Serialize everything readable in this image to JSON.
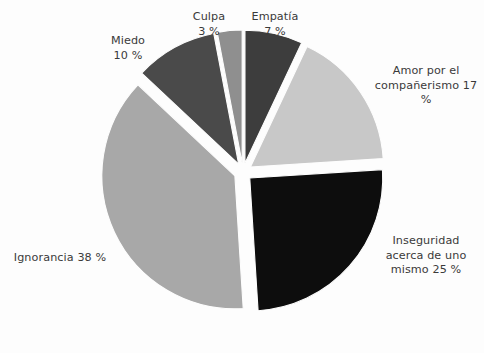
{
  "background_color": "#fdfdfd",
  "text_color": "#3a3a3a",
  "chart_data": {
    "type": "pie",
    "title": "",
    "subtitle": "",
    "xlabel": "",
    "ylabel": "",
    "legend_position": "none",
    "grid": false,
    "labels_outside": true,
    "exploded": true,
    "center": {
      "x": 243,
      "y": 172
    },
    "radius": 133,
    "explode_offset": 9,
    "start_angle_deg": -90,
    "direction": "clockwise",
    "categories": [
      "Empatía",
      "Amor por el compañerismo",
      "Inseguridad acerca de uno mismo",
      "Ignorancia",
      "Miedo",
      "Culpa"
    ],
    "values": [
      7,
      17,
      25,
      38,
      10,
      3
    ],
    "unit": "%",
    "colors": [
      "#3d3d3d",
      "#c8c8c8",
      "#0d0d0d",
      "#a8a8a8",
      "#4a4a4a",
      "#8f8f8f"
    ],
    "slices": [
      {
        "name": "Empatía",
        "value": 7,
        "value_text": "7 %",
        "color": "#3d3d3d",
        "label_text": "Empatía\n7 %",
        "start_angle_deg": -90,
        "end_angle_deg": -64.8,
        "mid_angle_deg": -77.4
      },
      {
        "name": "Amor por el compañerismo",
        "value": 17,
        "value_text": "17 %",
        "color": "#c8c8c8",
        "label_text": "Amor por el\ncompañerismo 17 %",
        "start_angle_deg": -64.8,
        "end_angle_deg": -3.6,
        "mid_angle_deg": -34.2
      },
      {
        "name": "Inseguridad acerca de uno mismo",
        "value": 25,
        "value_text": "25 %",
        "color": "#0d0d0d",
        "label_text": "Inseguridad\nacerca de uno\nmismo 25 %",
        "start_angle_deg": -3.6,
        "end_angle_deg": 86.4,
        "mid_angle_deg": 41.4
      },
      {
        "name": "Ignorancia",
        "value": 38,
        "value_text": "38 %",
        "color": "#a8a8a8",
        "label_text": "Ignorancia 38 %",
        "start_angle_deg": 86.4,
        "end_angle_deg": 223.2,
        "mid_angle_deg": 154.8
      },
      {
        "name": "Miedo",
        "value": 10,
        "value_text": "10 %",
        "color": "#4a4a4a",
        "label_text": "Miedo\n10 %",
        "start_angle_deg": 223.2,
        "end_angle_deg": 259.2,
        "mid_angle_deg": 241.2
      },
      {
        "name": "Culpa",
        "value": 3,
        "value_text": "3 %",
        "color": "#8f8f8f",
        "label_text": "Culpa\n3 %",
        "start_angle_deg": 259.2,
        "end_angle_deg": 270,
        "mid_angle_deg": 264.6
      }
    ]
  },
  "labels": {
    "empatia": "Empatía\n7 %",
    "amor": "Amor por el\ncompañerismo 17 %",
    "inseguridad": "Inseguridad\nacerca de uno\nmismo 25 %",
    "ignorancia": "Ignorancia 38 %",
    "miedo": "Miedo\n10 %",
    "culpa": "Culpa\n3 %"
  }
}
